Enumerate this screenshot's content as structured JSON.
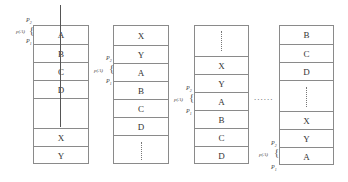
{
  "diagram": {
    "columns": [
      {
        "id": "stack-1",
        "cells": [
          "A",
          "B",
          "C",
          "D",
          "",
          "X",
          "Y"
        ],
        "marker": {
          "top": "P2",
          "bottom": "P1",
          "span_label": "p(A)",
          "at_cell": "A"
        },
        "has_vertical_line": true
      },
      {
        "id": "stack-2",
        "cells": [
          "X",
          "Y",
          "A",
          "B",
          "C",
          "D",
          "⋮"
        ],
        "marker": {
          "top": "P2",
          "bottom": "P1",
          "span_label": "p(A)",
          "at_cell": "A"
        }
      },
      {
        "id": "stack-3",
        "cells": [
          "⋮",
          "X",
          "Y",
          "A",
          "B",
          "C",
          "D"
        ],
        "marker": {
          "top": "P2",
          "bottom": "P1",
          "span_label": "p(A)",
          "at_cell": "A"
        }
      },
      {
        "id": "stack-4",
        "cells": [
          "B",
          "C",
          "D",
          "⋮",
          "X",
          "Y",
          "A"
        ],
        "marker": {
          "top": "P2",
          "bottom": "P1",
          "span_label": "p(A)",
          "at_cell": "A"
        }
      }
    ],
    "ellipsis": "......",
    "labels": {
      "p2": "P",
      "p2_sub": "2",
      "p1": "P",
      "p1_sub": "1",
      "pa": "p(A)"
    }
  }
}
